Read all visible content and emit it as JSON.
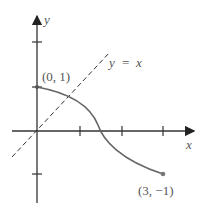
{
  "axes": {
    "x_label": "x",
    "y_label": "y"
  },
  "line": {
    "label_y": "y",
    "label_eq": "=",
    "label_x": "x",
    "style": "dashed"
  },
  "points": {
    "start_label": "(0, 1)",
    "end_label": "(3, −1)"
  },
  "colors": {
    "curve": "#666666",
    "axes": "#333333"
  }
}
